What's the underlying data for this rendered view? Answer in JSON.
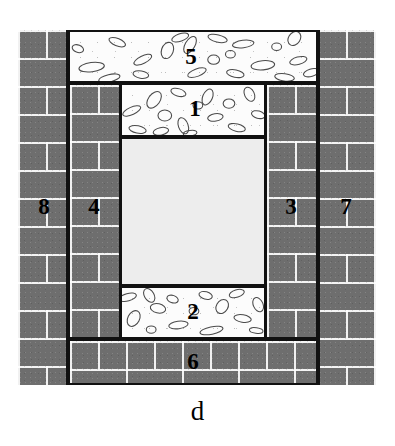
{
  "figure": {
    "caption": "d",
    "colors": {
      "masonry_fill": "#6e6e6e",
      "mortar_joint": "#ffffff",
      "concrete_fill": "#fcfcfc",
      "aggregate_stroke": "#4a4a4a",
      "void_fill": "#ededed",
      "outline": "#111111",
      "background": "#ffffff"
    }
  },
  "zones": [
    {
      "id": "zone-1",
      "label": "1",
      "material": "concrete",
      "description": "upper inner beam",
      "x": 120,
      "y": 83,
      "w": 146,
      "h": 54
    },
    {
      "id": "zone-2",
      "label": "2",
      "material": "concrete",
      "description": "lower inner beam",
      "x": 120,
      "y": 286,
      "w": 146,
      "h": 53
    },
    {
      "id": "zone-3",
      "label": "3",
      "material": "masonry",
      "description": "right inner column",
      "x": 265,
      "y": 83,
      "w": 53,
      "h": 256
    },
    {
      "id": "zone-4",
      "label": "4",
      "material": "masonry",
      "description": "left inner column",
      "x": 68,
      "y": 83,
      "w": 53,
      "h": 256
    },
    {
      "id": "zone-5",
      "label": "5",
      "material": "concrete",
      "description": "top beam spanning inner frame",
      "x": 68,
      "y": 30,
      "w": 250,
      "h": 53
    },
    {
      "id": "zone-6",
      "label": "6",
      "material": "masonry",
      "description": "bottom base course",
      "x": 68,
      "y": 339,
      "w": 250,
      "h": 46
    },
    {
      "id": "zone-7",
      "label": "7",
      "material": "masonry",
      "description": "right outer column",
      "x": 318,
      "y": 30,
      "w": 58,
      "h": 355
    },
    {
      "id": "zone-8",
      "label": "8",
      "material": "masonry",
      "description": "left outer column",
      "x": 18,
      "y": 30,
      "w": 50,
      "h": 355
    }
  ],
  "void": {
    "id": "central-void",
    "description": "central opening / infill panel",
    "x": 120,
    "y": 137,
    "w": 146,
    "h": 149
  },
  "frame": {
    "x": 18,
    "y": 30,
    "w": 358,
    "h": 355
  },
  "labels": {
    "one": "1",
    "two": "2",
    "three": "3",
    "four": "4",
    "five": "5",
    "six": "6",
    "seven": "7",
    "eight": "8"
  }
}
